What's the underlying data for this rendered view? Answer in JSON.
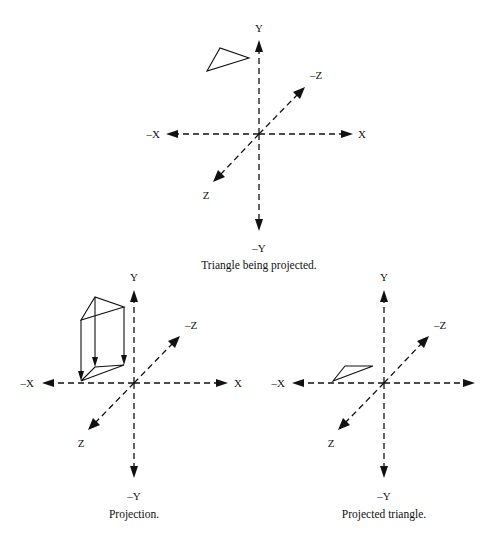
{
  "figures": [
    {
      "id": "top",
      "caption": "Triangle being projected.",
      "origin": [
        259,
        134
      ],
      "axes": {
        "y_label": "Y",
        "neg_y_label": "–Y",
        "x_label": "X",
        "neg_x_label": "–X",
        "z_label": "Z",
        "neg_z_label": "–Z"
      },
      "shape": "triangle in 3D space above and left of origin"
    },
    {
      "id": "bottom-left",
      "caption": "Projection.",
      "origin": [
        134,
        383
      ],
      "axes": {
        "y_label": "Y",
        "neg_y_label": "–Y",
        "x_label": "X",
        "neg_x_label": "–X",
        "z_label": "Z",
        "neg_z_label": "–Z"
      },
      "shape": "triangle with vertical projection arrows onto XZ plane"
    },
    {
      "id": "bottom-right",
      "caption": "Projected triangle.",
      "origin": [
        384,
        383
      ],
      "axes": {
        "y_label": "Y",
        "neg_y_label": "–Y",
        "neg_x_label": "–X",
        "z_label": "Z",
        "neg_z_label": "–Z"
      },
      "shape": "flattened triangle lying on XZ plane"
    }
  ],
  "colors": {
    "ink": "#111111",
    "background": "#ffffff"
  }
}
